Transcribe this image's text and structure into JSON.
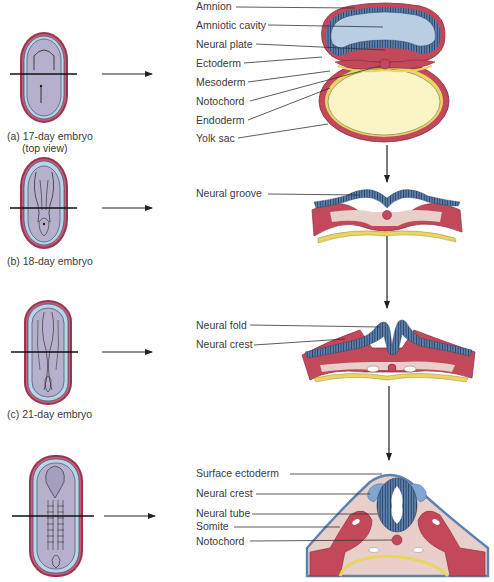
{
  "colors": {
    "mesoderm_red": "#c2485a",
    "mesoderm_dark": "#8a2a3c",
    "ectoderm_blue": "#5b82b0",
    "ectoderm_stripe": "#2a3f5e",
    "amniotic_blue": "#b9cde3",
    "yolk": "#fbf5c6",
    "endoderm_yellow": "#e8d660",
    "tissue_pink": "#e8cfc9",
    "embryo_lilac": "#b7b0cc",
    "embryo_rim_blue": "#b8d4e6",
    "embryo_rim_red": "#9a3550"
  },
  "stages": [
    {
      "id": "a",
      "caption_line1": "(a) 17-day embryo",
      "caption_line2": "(top view)"
    },
    {
      "id": "b",
      "caption_line1": "(b) 18-day embryo"
    },
    {
      "id": "c",
      "caption_line1": "(c) 21-day embryo"
    },
    {
      "id": "d"
    }
  ],
  "labels": {
    "stage_a": [
      "Amnion",
      "Amniotic cavity",
      "Neural plate",
      "Ectoderm",
      "Mesoderm",
      "Notochord",
      "Endoderm",
      "Yolk sac"
    ],
    "stage_b": [
      "Neural groove"
    ],
    "stage_c": [
      "Neural fold",
      "Neural crest"
    ],
    "stage_d": [
      "Surface ectoderm",
      "Neural crest",
      "Neural tube",
      "Somite",
      "Notochord"
    ]
  }
}
